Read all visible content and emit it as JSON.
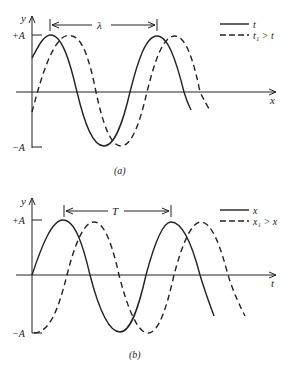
{
  "panels": [
    {
      "id": "a",
      "caption": "(a)",
      "y_label": "y",
      "x_label": "x",
      "y_ticks": [
        "+A",
        "−A"
      ],
      "span_label": "λ",
      "legend": [
        {
          "style": "solid",
          "label": "t"
        },
        {
          "style": "dashed",
          "label": "t₁ > t"
        }
      ]
    },
    {
      "id": "b",
      "caption": "(b)",
      "y_label": "y",
      "x_label": "t",
      "y_ticks": [
        "+A",
        "−A"
      ],
      "span_label": "T",
      "legend": [
        {
          "style": "solid",
          "label": "x"
        },
        {
          "style": "dashed",
          "label": "x₁ > x"
        }
      ]
    }
  ],
  "colors": {
    "ink": "#222222",
    "background": "#ffffff"
  }
}
